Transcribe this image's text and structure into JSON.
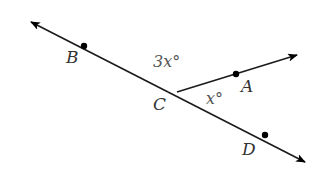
{
  "diagram": {
    "type": "geometry-angles",
    "colors": {
      "line": "#1a1a1a",
      "point": "#000000",
      "label": "#333333",
      "angle_label": "#555555",
      "background": "#ffffff"
    },
    "line_BD": {
      "tail": [
        31,
        22
      ],
      "head": [
        305,
        162
      ],
      "arrow_both_ends": true
    },
    "ray_CA": {
      "from": [
        177,
        92
      ],
      "to": [
        297,
        55
      ],
      "arrow_end": true
    },
    "points": [
      {
        "name": "B",
        "x": 84,
        "y": 46,
        "label": "B",
        "label_x": 66,
        "label_y": 63
      },
      {
        "name": "C",
        "x": 177,
        "y": 92,
        "label": "C",
        "label_x": 153,
        "label_y": 110
      },
      {
        "name": "A",
        "x": 236,
        "y": 74,
        "label": "A",
        "label_x": 241,
        "label_y": 92
      },
      {
        "name": "D",
        "x": 265,
        "y": 135,
        "label": "D",
        "label_x": 242,
        "label_y": 155
      }
    ],
    "angles": [
      {
        "name": "angle-BCA",
        "label": "3x°",
        "x": 153,
        "y": 67
      },
      {
        "name": "angle-ACD",
        "label": "x°",
        "x": 206,
        "y": 104
      }
    ]
  }
}
